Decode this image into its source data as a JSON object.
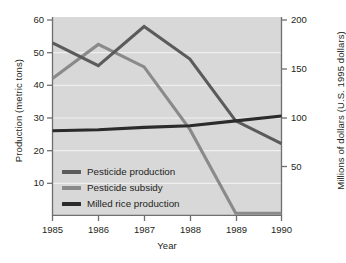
{
  "chart_data": {
    "type": "line",
    "title": "",
    "xlabel": "Year",
    "ylabel": "Production (metric tons)",
    "ylabel_right": "Millions of dollars (U.S. 1995 dollars)",
    "categories": [
      "1985",
      "1986",
      "1987",
      "1988",
      "1989",
      "1990"
    ],
    "x": [
      1985,
      1986,
      1987,
      1988,
      1989,
      1990
    ],
    "xlim": [
      1985,
      1990
    ],
    "ylim": [
      0,
      60
    ],
    "ylim_right": [
      0,
      200
    ],
    "yticks": [
      10,
      20,
      30,
      40,
      50,
      60
    ],
    "yticks_right": [
      50,
      100,
      150,
      200
    ],
    "grid": "horizontal-white",
    "legend_position": "inside-lower-left",
    "plot_background": "#d8d8d8",
    "series": [
      {
        "name": "Pesticide production",
        "axis": "left",
        "color": "#5b5b5b",
        "values": [
          53,
          46,
          58,
          48,
          29,
          22
        ]
      },
      {
        "name": "Pesticide subsidy",
        "axis": "right",
        "color": "#8a8a8a",
        "values": [
          140,
          175,
          152,
          88,
          2,
          2
        ]
      },
      {
        "name": "Milled rice production",
        "axis": "left",
        "color": "#2b2b2b",
        "values": [
          26,
          26.3,
          27,
          27.5,
          29,
          30.5
        ]
      }
    ]
  },
  "axes": {
    "left": {
      "title": "Production (metric tons)",
      "ticks": [
        "60",
        "50",
        "40",
        "30",
        "20",
        "10"
      ]
    },
    "right": {
      "title": "Millions of dollars (U.S. 1995 dollars)",
      "ticks": [
        "200",
        "150",
        "100",
        "50"
      ]
    },
    "bottom": {
      "title": "Year",
      "ticks": [
        "1985",
        "1986",
        "1987",
        "1988",
        "1989",
        "1990"
      ]
    }
  },
  "legend": {
    "items": [
      {
        "label": "Pesticide production",
        "color": "#5b5b5b"
      },
      {
        "label": "Pesticide subsidy",
        "color": "#8a8a8a"
      },
      {
        "label": "Milled rice production",
        "color": "#2b2b2b"
      }
    ]
  }
}
